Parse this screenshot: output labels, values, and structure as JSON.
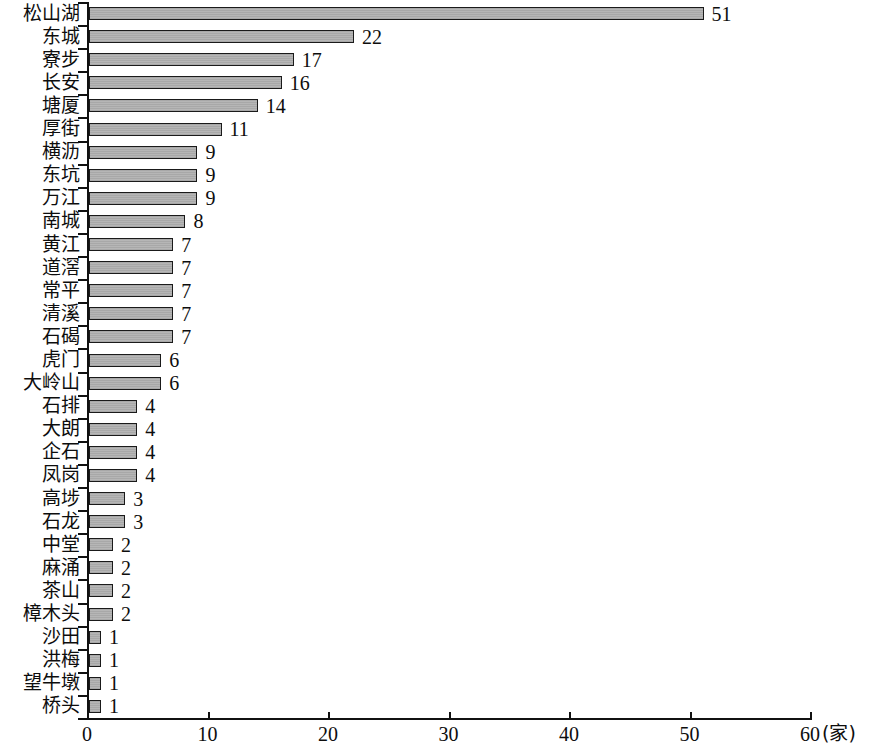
{
  "chart_data": {
    "type": "bar",
    "orientation": "horizontal",
    "title": "",
    "xlabel": "(家)",
    "ylabel": "",
    "xlim": [
      0,
      60
    ],
    "xticks": [
      0,
      10,
      20,
      30,
      40,
      50,
      60
    ],
    "xtick_labels": [
      "0",
      "10",
      "20",
      "30",
      "40",
      "50",
      "60"
    ],
    "grid": false,
    "legend": null,
    "unit_label": "(家)",
    "categories": [
      "松山湖",
      "东城",
      "寮步",
      "长安",
      "塘厦",
      "厚街",
      "横沥",
      "东坑",
      "万江",
      "南城",
      "黄江",
      "道滘",
      "常平",
      "清溪",
      "石碣",
      "虎门",
      "大岭山",
      "石排",
      "大朗",
      "企石",
      "凤岗",
      "高埗",
      "石龙",
      "中堂",
      "麻涌",
      "茶山",
      "樟木头",
      "沙田",
      "洪梅",
      "望牛墩",
      "桥头"
    ],
    "values": [
      51,
      22,
      17,
      16,
      14,
      11,
      9,
      9,
      9,
      8,
      7,
      7,
      7,
      7,
      7,
      6,
      6,
      4,
      4,
      4,
      4,
      3,
      3,
      2,
      2,
      2,
      2,
      1,
      1,
      1,
      1
    ],
    "value_labels": [
      "51",
      "22",
      "17",
      "16",
      "14",
      "11",
      "9",
      "9",
      "9",
      "8",
      "7",
      "7",
      "7",
      "7",
      "7",
      "6",
      "6",
      "4",
      "4",
      "4",
      "4",
      "3",
      "3",
      "2",
      "2",
      "2",
      "2",
      "1",
      "1",
      "1",
      "1"
    ],
    "bar_fill_color": "#b0b0b0",
    "bar_edge_color": "#1a1a1a",
    "axis_color": "#111111"
  }
}
